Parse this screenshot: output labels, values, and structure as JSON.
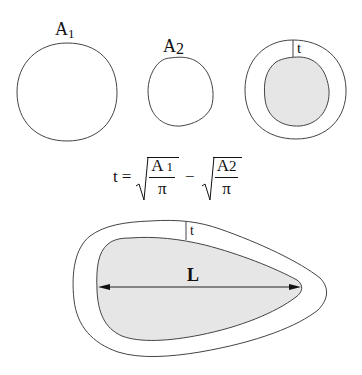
{
  "figure": {
    "top_row": {
      "circle1": {
        "label_main": "A",
        "label_sub": "1"
      },
      "circle2": {
        "label_main": "A",
        "label_sub": "2"
      },
      "ring": {
        "thickness_label": "t"
      }
    },
    "formula": {
      "lhs": "t",
      "equals": "=",
      "term1": {
        "numerator_main": "A",
        "numerator_sub": "1",
        "denominator": "π"
      },
      "minus": "−",
      "term2": {
        "numerator_main": "A",
        "numerator_sub": "2",
        "denominator": "π"
      }
    },
    "bottom": {
      "thickness_label": "t",
      "length_label": "L"
    },
    "colors": {
      "stroke": "#333333",
      "fill_inner": "#e6e6e6",
      "background": "#ffffff"
    }
  }
}
